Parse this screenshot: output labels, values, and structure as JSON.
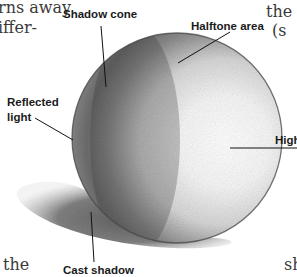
{
  "figure": {
    "labels": {
      "shadow_cone": "Shadow cone",
      "halftone_area": "Halftone area",
      "reflected_light_line1": "Reflected",
      "reflected_light_line2": "light",
      "highlight": "High",
      "cast_shadow": "Cast shadow"
    }
  },
  "surrounding_text": {
    "top_left_line1": "rns away",
    "top_left_line2": "iffer-",
    "top_right_line1": "the c",
    "top_right_line2": "(s",
    "bottom_left": "the",
    "bottom_right": "sh"
  },
  "colors": {
    "background": "#ffffff",
    "sphere_light": "#ffffff",
    "sphere_dark": "#555555",
    "outline": "#444444",
    "leader_line": "#111111"
  }
}
